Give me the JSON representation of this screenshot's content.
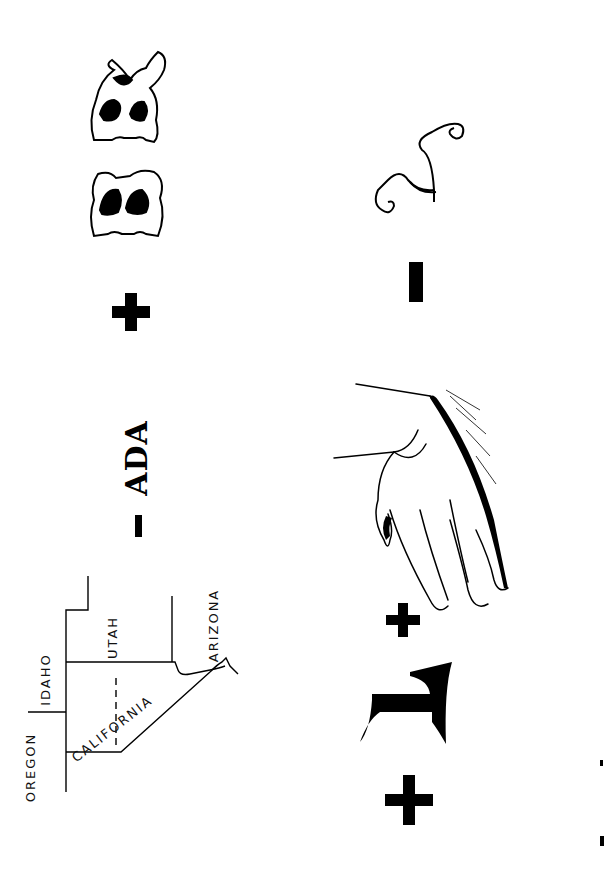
{
  "puzzle": {
    "type": "rebus",
    "orientation": "rotated 90 degrees counter-clockwise",
    "row1": {
      "map": {
        "states": [
          "OREGON",
          "IDAHO",
          "UTAH",
          "ARIZONA",
          "CALIFORNIA"
        ],
        "highlighted_region": "NEVADA (unlabeled)"
      },
      "operator1": "-",
      "text": "ADA",
      "operator2": "+",
      "ornate_letters": "ER"
    },
    "row2": {
      "operator1": "+",
      "letter": "L",
      "operator2": "+",
      "image": "hand",
      "operator3": "-",
      "script_letter": "h"
    },
    "colors": {
      "ink": "#000000",
      "paper": "#ffffff"
    }
  }
}
